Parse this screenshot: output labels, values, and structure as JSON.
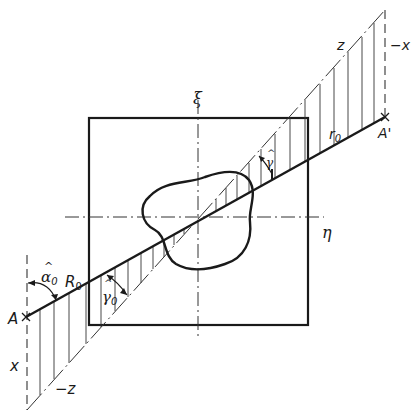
{
  "figure": {
    "type": "technical-diagram",
    "colors": {
      "ink": "#1a1a1a",
      "background": "#ffffff"
    }
  },
  "axes": {
    "xi": {
      "label": "ξ"
    },
    "eta": {
      "label": "η"
    }
  },
  "points": {
    "A": {
      "label": "A"
    },
    "A_prime": {
      "label": "A'"
    }
  },
  "labels": {
    "z_top": "z",
    "minus_x_top": "−x",
    "r0": "r",
    "r0_sub": "0",
    "gamma": "γ",
    "gamma0": "γ",
    "gamma0_sub": "0",
    "alpha0": "α",
    "alpha0_sub": "0",
    "R0": "R",
    "R0_sub": "0",
    "x_bottom": "x",
    "minus_z_bottom": "−z",
    "hat": "^"
  }
}
